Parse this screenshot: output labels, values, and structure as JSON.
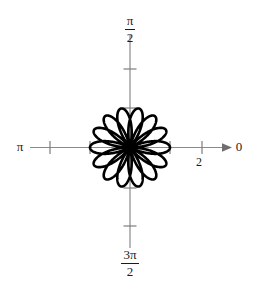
{
  "figure": {
    "kind": "polar-plot",
    "background_color": "#ffffff",
    "curve_color": "#000000",
    "axis_color": "#808080",
    "text_color": "#1a1a1a"
  },
  "axes": {
    "angle_labels": {
      "right": "0",
      "top_numerator": "π",
      "top_denominator": "2",
      "left": "π",
      "bottom_numerator": "3π",
      "bottom_denominator": "2"
    },
    "radial_tick_label": "2",
    "radial_tick_values": [
      1,
      2
    ],
    "arrow_direction": "right"
  },
  "chart_data": {
    "type": "line",
    "plot_kind": "polar-rose",
    "title": "",
    "xlabel": "",
    "ylabel": "",
    "equation": "r = cos(7θ/2)",
    "petal_count": 7,
    "petal_max_radius": 1.0,
    "theta_range_deg": [
      0,
      720
    ],
    "petal_angles_deg": [
      0,
      51.43,
      102.86,
      154.29,
      205.71,
      257.14,
      308.57
    ],
    "radial_axis_max": 2.4,
    "radial_ticks": [
      1,
      2
    ],
    "angular_tick_labels": [
      "0",
      "π/2",
      "π",
      "3π/2"
    ],
    "grid": false,
    "legend": null,
    "series": [
      {
        "name": "r = cos(7θ/2)",
        "color": "#000000",
        "line_width": 2.6
      }
    ]
  }
}
